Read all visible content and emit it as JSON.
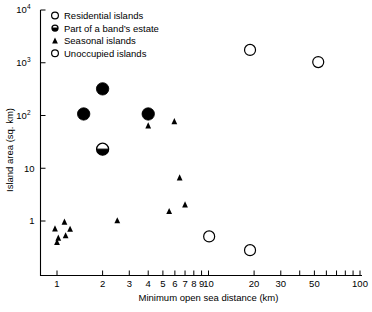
{
  "chart_data": {
    "type": "scatter",
    "title": "",
    "xlabel": "Minimum open sea distance (km)",
    "ylabel": "Island area (sq. km)",
    "xscale": "log",
    "yscale": "log",
    "xlim": [
      0.8,
      100
    ],
    "ylim": [
      0.2,
      10000
    ],
    "grid": false,
    "legend_position": "top-left-inside",
    "x_tick_labels": [
      "1",
      "2",
      "3",
      "4",
      "5",
      "6",
      "7",
      "8",
      "9",
      "10",
      "20",
      "30",
      "50",
      "100"
    ],
    "x_tick_values": [
      1,
      2,
      3,
      4,
      5,
      6,
      7,
      8,
      9,
      10,
      20,
      30,
      50,
      100
    ],
    "x_minor_ticks": [
      40,
      60,
      70,
      80,
      90
    ],
    "y_tick_labels": [
      "1",
      "10",
      "10^2",
      "10^3",
      "10^4"
    ],
    "y_tick_values": [
      1,
      10,
      100,
      1000,
      10000
    ],
    "y_tick_display": [
      {
        "base": "1",
        "exp": ""
      },
      {
        "base": "10",
        "exp": ""
      },
      {
        "base": "10",
        "exp": "2"
      },
      {
        "base": "10",
        "exp": "3"
      },
      {
        "base": "10",
        "exp": "4"
      }
    ],
    "series": [
      {
        "name": "Residential islands",
        "marker": "open-circle",
        "marker_size": "large",
        "color": "#000000",
        "points": []
      },
      {
        "name": "Part of a band's estate",
        "marker": "half-filled-circle",
        "marker_size": "large",
        "color": "#000000",
        "points": [
          {
            "x": 2.0,
            "y": 23
          }
        ]
      },
      {
        "name": "Seasonal islands",
        "marker": "filled-triangle",
        "marker_size": "small",
        "color": "#000000",
        "points": [
          {
            "x": 0.97,
            "y": 0.7
          },
          {
            "x": 1.02,
            "y": 0.47
          },
          {
            "x": 1.0,
            "y": 0.39
          },
          {
            "x": 1.12,
            "y": 0.94
          },
          {
            "x": 1.14,
            "y": 0.52
          },
          {
            "x": 1.22,
            "y": 0.69
          },
          {
            "x": 2.5,
            "y": 1.0
          },
          {
            "x": 4.0,
            "y": 63
          },
          {
            "x": 5.5,
            "y": 1.5
          },
          {
            "x": 5.95,
            "y": 76
          },
          {
            "x": 6.45,
            "y": 6.5
          },
          {
            "x": 7.0,
            "y": 2.0
          }
        ]
      },
      {
        "name": "Unoccupied islands",
        "marker": "open-circle",
        "marker_size": "large",
        "color": "#000000",
        "points": [
          {
            "x": 18.8,
            "y": 1750
          },
          {
            "x": 53.0,
            "y": 1030
          },
          {
            "x": 10.1,
            "y": 0.51
          },
          {
            "x": 18.8,
            "y": 0.28
          }
        ]
      },
      {
        "name": "Filled circles (occupied)",
        "marker": "filled-circle",
        "marker_size": "large",
        "color": "#000000",
        "points": [
          {
            "x": 1.5,
            "y": 107
          },
          {
            "x": 2.0,
            "y": 320
          },
          {
            "x": 4.0,
            "y": 107
          }
        ]
      }
    ],
    "legend": [
      {
        "label": "Residential islands",
        "marker": "open-circle"
      },
      {
        "label": "Part of a band’s estate",
        "marker": "half-filled-circle"
      },
      {
        "label": "Seasonal islands",
        "marker": "filled-triangle"
      },
      {
        "label": "Unoccupied islands",
        "marker": "open-circle"
      }
    ]
  }
}
